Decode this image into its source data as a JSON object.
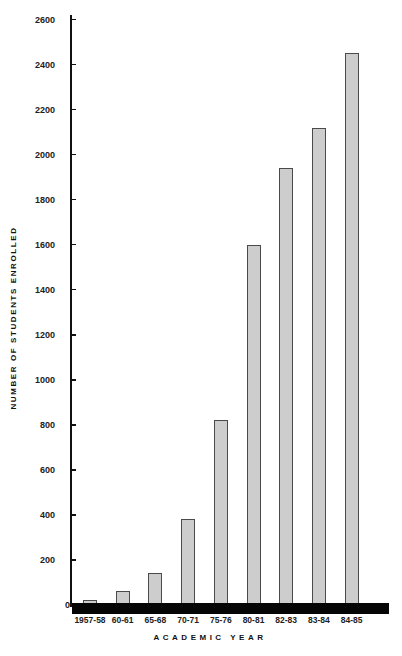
{
  "chart_data": {
    "type": "bar",
    "title": "",
    "xlabel": "ACADEMIC YEAR",
    "ylabel": "NUMBER OF STUDENTS ENROLLED",
    "categories": [
      "1957-58",
      "60-61",
      "65-68",
      "70-71",
      "75-76",
      "80-81",
      "82-83",
      "83-84",
      "84-85"
    ],
    "values": [
      20,
      60,
      140,
      380,
      820,
      1600,
      1940,
      2120,
      2450
    ],
    "ylim": [
      0,
      2600
    ],
    "yticks": [
      0,
      200,
      400,
      600,
      800,
      1000,
      1200,
      1400,
      1600,
      1800,
      2000,
      2200,
      2400,
      2600
    ],
    "ytick_labels": [
      "0",
      "200",
      "400",
      "600",
      "800",
      "1000",
      "1200",
      "1400",
      "1600",
      "1800",
      "2000",
      "2200",
      "2400",
      "2600"
    ],
    "grid": false,
    "legend": null,
    "colors": {
      "bar_fill": "#cdcdcd",
      "bar_edge": "#4a4a4a",
      "axis": "#111111",
      "baseline": "#050505"
    }
  }
}
